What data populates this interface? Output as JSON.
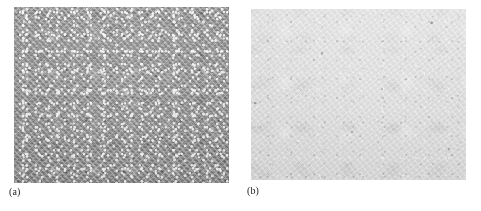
{
  "figure": {
    "background_color": "#ffffff",
    "width": 481,
    "height": 211,
    "panel_count": 2
  },
  "panels": [
    {
      "id": "a",
      "caption": "(a)",
      "kind": "micrograph",
      "base_color": "#8f8f8f",
      "appearance": "medium-gray surface with dense fine bright speckles (coarse granular / porous microstructure)",
      "x": 14,
      "y": 7,
      "width": 215,
      "height": 176
    },
    {
      "id": "b",
      "caption": "(b)",
      "kind": "micrograph",
      "base_color": "#d9d9d9",
      "appearance": "very light gray surface with fine smooth mottled texture and sparse dark specks",
      "x": 251,
      "y": 9,
      "width": 215,
      "height": 171
    }
  ],
  "captions": {
    "panel_a": "(a)",
    "panel_b": "(b)"
  }
}
